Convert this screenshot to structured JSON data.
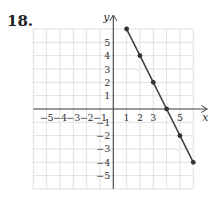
{
  "problem": {
    "number": "18."
  },
  "chart_data": {
    "type": "line",
    "title": "",
    "xlabel": "x",
    "ylabel": "y",
    "xlim": [
      -6,
      6
    ],
    "ylim": [
      -6,
      6
    ],
    "grid": true,
    "x_tick_labels": [
      "-5",
      "-4",
      "-3",
      "-2",
      "-1",
      "1",
      "2",
      "3",
      "5"
    ],
    "y_tick_labels": [
      "5",
      "4",
      "3",
      "2",
      "1",
      "-1",
      "-2",
      "-3",
      "-4",
      "-5"
    ],
    "series": [
      {
        "name": "line",
        "x": [
          1,
          2,
          3,
          4,
          5,
          6
        ],
        "y": [
          6,
          4,
          2,
          0,
          -2,
          -4
        ],
        "markers": true
      }
    ],
    "colors": {
      "line": "#444444",
      "grid": "#d9d9d9",
      "axis": "#444444"
    }
  }
}
